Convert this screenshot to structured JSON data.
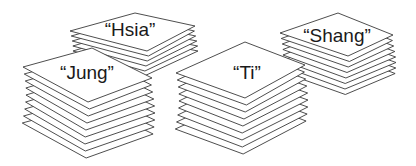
{
  "stacks": [
    {
      "id": "hsia",
      "label": "“Hsia”",
      "top": [
        [
          70,
          31
        ],
        [
          135,
          13
        ],
        [
          195,
          26
        ],
        [
          147,
          51
        ]
      ],
      "count": 6,
      "step": 5,
      "labelPos": [
        130,
        30
      ]
    },
    {
      "id": "shang",
      "label": "“Shang”",
      "top": [
        [
          280,
          33
        ],
        [
          338,
          13
        ],
        [
          393,
          35
        ],
        [
          348,
          56
        ]
      ],
      "count": 8,
      "step": 5.5,
      "labelPos": [
        337,
        36
      ]
    },
    {
      "id": "jung",
      "label": "“Jung”",
      "top": [
        [
          23,
          67
        ],
        [
          92,
          48
        ],
        [
          152,
          78
        ],
        [
          88,
          102
        ]
      ],
      "count": 9,
      "step": 7,
      "labelPos": [
        87,
        73
      ]
    },
    {
      "id": "ti",
      "label": "“Ti”",
      "top": [
        [
          176,
          73
        ],
        [
          245,
          42
        ],
        [
          305,
          65
        ],
        [
          245,
          98
        ]
      ],
      "count": 9,
      "step": 7,
      "labelPos": [
        247,
        73
      ]
    }
  ],
  "colors": {
    "stroke": "#3a3a3a",
    "paper": "#ffffff",
    "text": "#1a1a1a"
  }
}
